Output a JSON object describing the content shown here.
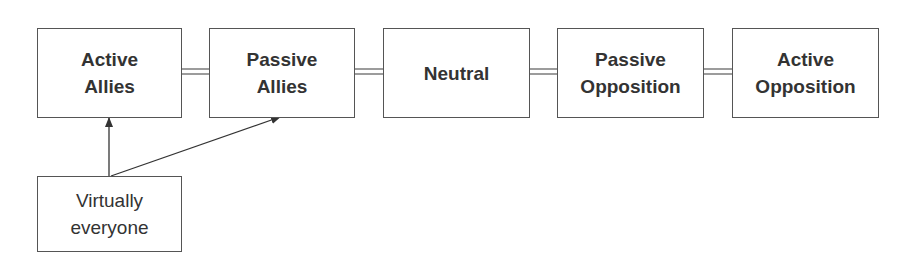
{
  "diagram": {
    "nodes": [
      {
        "id": "active-allies",
        "label": "Active\nAllies"
      },
      {
        "id": "passive-allies",
        "label": "Passive\nAllies"
      },
      {
        "id": "neutral",
        "label": "Neutral"
      },
      {
        "id": "passive-opposition",
        "label": "Passive\nOpposition"
      },
      {
        "id": "active-opposition",
        "label": "Active\nOpposition"
      },
      {
        "id": "virtually-everyone",
        "label": "Virtually\neveryone"
      }
    ],
    "edges": [
      {
        "from": "active-allies",
        "to": "passive-allies",
        "style": "double-line"
      },
      {
        "from": "passive-allies",
        "to": "neutral",
        "style": "double-line"
      },
      {
        "from": "neutral",
        "to": "passive-opposition",
        "style": "double-line"
      },
      {
        "from": "passive-opposition",
        "to": "active-opposition",
        "style": "double-line"
      },
      {
        "from": "virtually-everyone",
        "to": "active-allies",
        "style": "arrow"
      },
      {
        "from": "virtually-everyone",
        "to": "passive-allies",
        "style": "arrow"
      }
    ]
  }
}
